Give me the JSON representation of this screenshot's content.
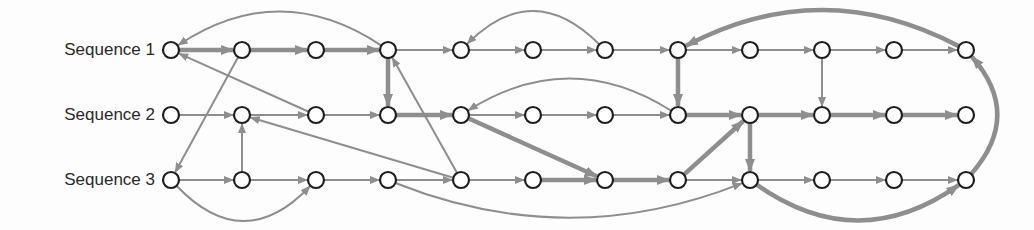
{
  "diagram": {
    "type": "sequence-alignment-graph",
    "edge_color": "#8e8e8e",
    "node_stroke": "#1e1e1e",
    "node_fill": "#ffffff",
    "columns_x": [
      171,
      242,
      316,
      388,
      461,
      533,
      605,
      678,
      750,
      822,
      894,
      966
    ],
    "rows": [
      {
        "label": "Sequence 1",
        "y": 50,
        "node_count": 12
      },
      {
        "label": "Sequence 2",
        "y": 115,
        "node_count": 12
      },
      {
        "label": "Sequence 3",
        "y": 180,
        "node_count": 12
      }
    ],
    "edges": [
      {
        "from": [
          0,
          0
        ],
        "to": [
          0,
          1
        ],
        "weight": "thick"
      },
      {
        "from": [
          0,
          1
        ],
        "to": [
          0,
          2
        ],
        "weight": "thick"
      },
      {
        "from": [
          0,
          2
        ],
        "to": [
          0,
          3
        ],
        "weight": "thick"
      },
      {
        "from": [
          0,
          3
        ],
        "to": [
          0,
          4
        ],
        "weight": "thin"
      },
      {
        "from": [
          0,
          4
        ],
        "to": [
          0,
          5
        ],
        "weight": "thin"
      },
      {
        "from": [
          0,
          5
        ],
        "to": [
          0,
          6
        ],
        "weight": "thin"
      },
      {
        "from": [
          0,
          6
        ],
        "to": [
          0,
          7
        ],
        "weight": "thin"
      },
      {
        "from": [
          0,
          7
        ],
        "to": [
          0,
          8
        ],
        "weight": "thin"
      },
      {
        "from": [
          0,
          8
        ],
        "to": [
          0,
          9
        ],
        "weight": "thin"
      },
      {
        "from": [
          0,
          9
        ],
        "to": [
          0,
          10
        ],
        "weight": "thin"
      },
      {
        "from": [
          0,
          10
        ],
        "to": [
          0,
          11
        ],
        "weight": "thin"
      },
      {
        "from": [
          1,
          0
        ],
        "to": [
          1,
          1
        ],
        "weight": "thin"
      },
      {
        "from": [
          1,
          1
        ],
        "to": [
          1,
          2
        ],
        "weight": "thin"
      },
      {
        "from": [
          1,
          2
        ],
        "to": [
          1,
          3
        ],
        "weight": "thin"
      },
      {
        "from": [
          1,
          3
        ],
        "to": [
          1,
          4
        ],
        "weight": "thick"
      },
      {
        "from": [
          1,
          4
        ],
        "to": [
          1,
          5
        ],
        "weight": "thin"
      },
      {
        "from": [
          1,
          5
        ],
        "to": [
          1,
          6
        ],
        "weight": "thin"
      },
      {
        "from": [
          1,
          6
        ],
        "to": [
          1,
          7
        ],
        "weight": "thin"
      },
      {
        "from": [
          1,
          7
        ],
        "to": [
          1,
          8
        ],
        "weight": "thick"
      },
      {
        "from": [
          1,
          8
        ],
        "to": [
          1,
          9
        ],
        "weight": "thick"
      },
      {
        "from": [
          1,
          9
        ],
        "to": [
          1,
          10
        ],
        "weight": "thick"
      },
      {
        "from": [
          1,
          10
        ],
        "to": [
          1,
          11
        ],
        "weight": "thick"
      },
      {
        "from": [
          2,
          0
        ],
        "to": [
          2,
          1
        ],
        "weight": "thin"
      },
      {
        "from": [
          2,
          1
        ],
        "to": [
          2,
          2
        ],
        "weight": "thin"
      },
      {
        "from": [
          2,
          2
        ],
        "to": [
          2,
          3
        ],
        "weight": "thin"
      },
      {
        "from": [
          2,
          3
        ],
        "to": [
          2,
          4
        ],
        "weight": "thin"
      },
      {
        "from": [
          2,
          4
        ],
        "to": [
          2,
          5
        ],
        "weight": "thin"
      },
      {
        "from": [
          2,
          5
        ],
        "to": [
          2,
          6
        ],
        "weight": "thick"
      },
      {
        "from": [
          2,
          6
        ],
        "to": [
          2,
          7
        ],
        "weight": "thick"
      },
      {
        "from": [
          2,
          7
        ],
        "to": [
          2,
          8
        ],
        "weight": "thin"
      },
      {
        "from": [
          2,
          8
        ],
        "to": [
          2,
          9
        ],
        "weight": "thin"
      },
      {
        "from": [
          2,
          9
        ],
        "to": [
          2,
          10
        ],
        "weight": "thin"
      },
      {
        "from": [
          2,
          10
        ],
        "to": [
          2,
          11
        ],
        "weight": "thin"
      },
      {
        "from": [
          0,
          3
        ],
        "to": [
          0,
          0
        ],
        "weight": "thin",
        "curve": "above",
        "bend": 38
      },
      {
        "from": [
          0,
          6
        ],
        "to": [
          0,
          4
        ],
        "weight": "thin",
        "curve": "above",
        "bend": 38
      },
      {
        "from": [
          0,
          11
        ],
        "to": [
          0,
          7
        ],
        "weight": "thick",
        "curve": "above",
        "bend": 40
      },
      {
        "from": [
          1,
          2
        ],
        "to": [
          0,
          0
        ],
        "weight": "thin"
      },
      {
        "from": [
          0,
          1
        ],
        "to": [
          2,
          0
        ],
        "weight": "thin"
      },
      {
        "from": [
          2,
          1
        ],
        "to": [
          1,
          1
        ],
        "weight": "thin"
      },
      {
        "from": [
          2,
          4
        ],
        "to": [
          1,
          1
        ],
        "weight": "thin"
      },
      {
        "from": [
          2,
          0
        ],
        "to": [
          2,
          2
        ],
        "weight": "thin",
        "curve": "below",
        "bend": 40
      },
      {
        "from": [
          0,
          3
        ],
        "to": [
          1,
          3
        ],
        "weight": "thick"
      },
      {
        "from": [
          2,
          4
        ],
        "to": [
          0,
          3
        ],
        "weight": "thin"
      },
      {
        "from": [
          2,
          3
        ],
        "to": [
          2,
          8
        ],
        "weight": "thin",
        "curve": "below",
        "bend": 38
      },
      {
        "from": [
          1,
          4
        ],
        "to": [
          2,
          6
        ],
        "weight": "thick"
      },
      {
        "from": [
          1,
          7
        ],
        "to": [
          1,
          4
        ],
        "weight": "thin",
        "curve": "above",
        "bend": 36
      },
      {
        "from": [
          0,
          7
        ],
        "to": [
          1,
          7
        ],
        "weight": "thick"
      },
      {
        "from": [
          2,
          7
        ],
        "to": [
          1,
          8
        ],
        "weight": "thick"
      },
      {
        "from": [
          1,
          8
        ],
        "to": [
          2,
          8
        ],
        "weight": "thick"
      },
      {
        "from": [
          0,
          9
        ],
        "to": [
          1,
          9
        ],
        "weight": "thin"
      },
      {
        "from": [
          2,
          8
        ],
        "to": [
          2,
          11
        ],
        "weight": "thick",
        "curve": "below",
        "bend": 40
      },
      {
        "from": [
          2,
          11
        ],
        "to": [
          0,
          11
        ],
        "weight": "thick",
        "curve": "right",
        "bend": 30
      }
    ]
  }
}
